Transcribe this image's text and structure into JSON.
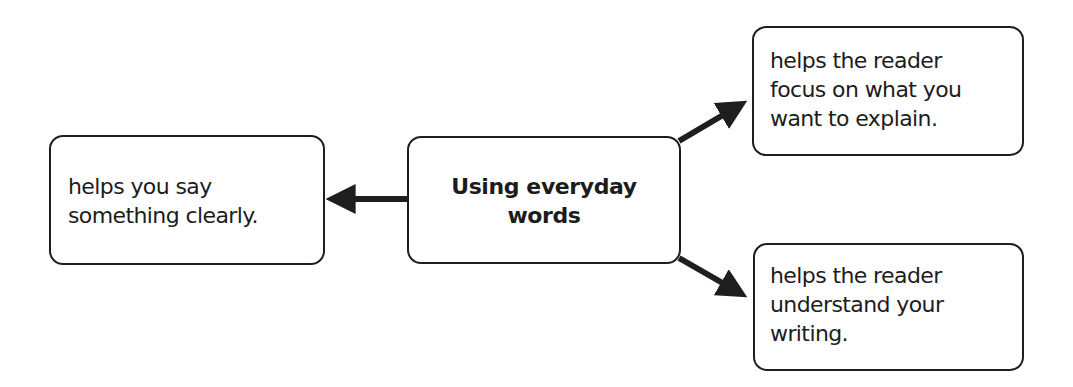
{
  "diagram": {
    "type": "concept-map",
    "center": {
      "lines": [
        "Using everyday",
        "words"
      ]
    },
    "left": {
      "lines": [
        "helps you say",
        "something clearly."
      ]
    },
    "top_right": {
      "lines": [
        "helps the reader",
        "focus on what you",
        "want to explain."
      ]
    },
    "bottom_right": {
      "lines": [
        "helps the reader",
        "understand your",
        "writing."
      ]
    },
    "edges": [
      {
        "from": "center",
        "to": "left"
      },
      {
        "from": "center",
        "to": "top_right"
      },
      {
        "from": "center",
        "to": "bottom_right"
      }
    ],
    "colors": {
      "stroke": "#1e1e1e",
      "text": "#1c1c1c",
      "background": "#ffffff"
    }
  }
}
